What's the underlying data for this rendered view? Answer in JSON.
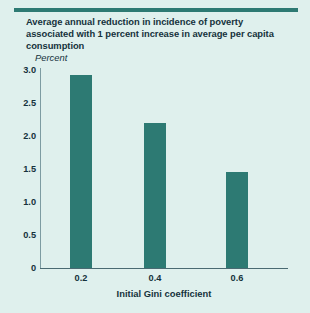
{
  "figure": {
    "title_lines": [
      "Average annual reduction in incidence of poverty",
      "associated with 1 percent increase in average per capita",
      "consumption"
    ],
    "unit_label": "Percent",
    "background_color": "#dff0ed",
    "bar_color": "#2d7a73",
    "text_color": "#15323c",
    "rule_color": "#2d7a73"
  },
  "chart_data": {
    "type": "bar",
    "title": "Average annual reduction in incidence of poverty associated with 1 percent increase in average per capita consumption",
    "categories": [
      "0.2",
      "0.4",
      "0.6"
    ],
    "values": [
      2.93,
      2.2,
      1.45
    ],
    "xlabel": "Initial Gini coefficient",
    "ylabel": "Percent",
    "ylim": [
      0,
      3.0
    ],
    "yticks": [
      "0",
      "0.5",
      "1.0",
      "1.5",
      "2.0",
      "2.5",
      "3.0"
    ],
    "ytick_values": [
      0,
      0.5,
      1.0,
      1.5,
      2.0,
      2.5,
      3.0
    ],
    "grid": false,
    "legend": "none"
  }
}
